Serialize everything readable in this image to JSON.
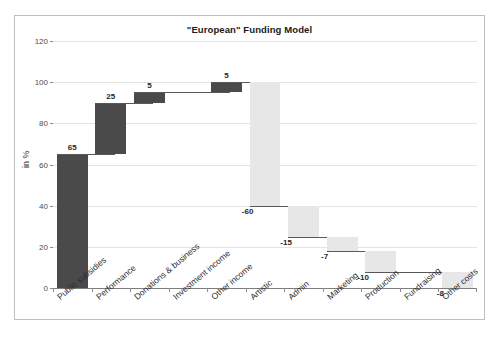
{
  "chart_data": {
    "type": "bar",
    "subtype": "waterfall",
    "title": "\"European\" Funding Model",
    "xlabel": "",
    "ylabel": "in %",
    "ylim": [
      0,
      120
    ],
    "ytick_step": 20,
    "yticks": [
      "0",
      "20",
      "40",
      "60",
      "80",
      "100",
      "120"
    ],
    "grid": true,
    "legend": "none",
    "categories": [
      "Public subsidies",
      "Performance",
      "Donations & business",
      "Investment income",
      "Other income",
      "Artistic",
      "Admin",
      "Marketing",
      "Production",
      "Fundraising",
      "Other costs"
    ],
    "values": [
      65,
      25,
      5,
      0,
      5,
      -60,
      -15,
      -7,
      -10,
      0,
      -8
    ],
    "cumulative_start": [
      0,
      65,
      90,
      95,
      95,
      100,
      40,
      25,
      18,
      8,
      8
    ],
    "cumulative_end": [
      65,
      90,
      95,
      95,
      100,
      40,
      25,
      18,
      8,
      8,
      0
    ],
    "data_labels": [
      "65",
      "25",
      "5",
      "",
      "5",
      "-60",
      "-15",
      "-7",
      "-10",
      "",
      "-8"
    ],
    "colors": {
      "positive": "#4a4a4a",
      "negative": "#e7e7e7",
      "gridline": "#e3e3e3",
      "axis": "#7d7d7d",
      "connector": "#595959",
      "frame": "#bfbfbf",
      "text": "#1f1f1f"
    }
  }
}
